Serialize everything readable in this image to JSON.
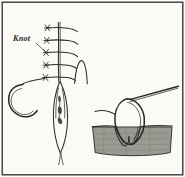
{
  "figure": {
    "background_color": "#fdfdfb",
    "panel_background": "#fbfaf7",
    "border_color": "#3a3a3a",
    "ink_color": "#2e2c2b",
    "tissue_color": "#9a9a93",
    "labels": [
      {
        "id": "knot",
        "text": "Knot",
        "x": 13,
        "y": 41,
        "style": "italic-bold",
        "leader_to_x": 48,
        "leader_to_y": 54
      }
    ],
    "panels": [
      {
        "id": "surface-view",
        "name": "Surface view of sutured wound",
        "suture_count": 5,
        "has_needle_loop": true,
        "has_thread_tail": true
      },
      {
        "id": "cross-section-view",
        "name": "Cross-section of skin with suture loop",
        "tissue_label": "skin tissue",
        "has_needle": true
      }
    ],
    "elements": {
      "incision_label": "incision line",
      "wound_label": "open wound",
      "thread_label": "suture thread",
      "needle_label": "curved needle",
      "skin_surface_label": "skin surface"
    }
  }
}
